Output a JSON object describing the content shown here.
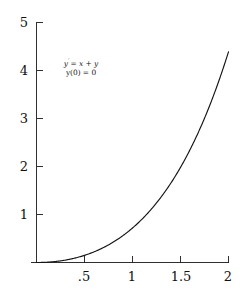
{
  "figure": {
    "background_color": "#ffffff",
    "line_color": "#141414",
    "axis_color": "#1a1a1a",
    "text_color": "#111111"
  },
  "annotation": {
    "line1_lhs": "y",
    "line1_prime": "′",
    "line1_rhs": "= x + y",
    "line2": "y(0) = 0",
    "full_text": "y' = x + y ;  y(0) = 0"
  },
  "axes": {
    "x_labels": [
      ".5",
      "1",
      "1.5",
      "2"
    ],
    "y_labels": [
      "1",
      "2",
      "3",
      "4",
      "5"
    ]
  },
  "chart_data": {
    "type": "line",
    "title": "",
    "subtitle": "",
    "xlabel": "",
    "ylabel": "",
    "xlim": [
      0,
      2
    ],
    "ylim": [
      0,
      5
    ],
    "grid": false,
    "legend": false,
    "annotations": [
      {
        "text": "y' = x + y",
        "x": 0.48,
        "y": 4.07
      },
      {
        "text": "y(0) = 0",
        "x": 0.48,
        "y": 3.87
      }
    ],
    "xticks": [
      0.5,
      1,
      1.5,
      2
    ],
    "xticklabels": [
      ".5",
      "1",
      "1.5",
      "2"
    ],
    "yticks": [
      1,
      2,
      3,
      4,
      5
    ],
    "yticklabels": [
      "1",
      "2",
      "3",
      "4",
      "5"
    ],
    "series": [
      {
        "name": "y = e^x - x - 1",
        "equation": "y = e^x - x - 1",
        "description": "Solution of the initial value problem y' = x + y, y(0) = 0",
        "x": [
          0,
          0.1,
          0.2,
          0.3,
          0.4,
          0.5,
          0.6,
          0.7,
          0.8,
          0.9,
          1.0,
          1.1,
          1.2,
          1.3,
          1.4,
          1.5,
          1.6,
          1.7,
          1.8,
          1.9,
          2.0
        ],
        "values": [
          0,
          0.0052,
          0.0214,
          0.0499,
          0.0918,
          0.1487,
          0.2221,
          0.3138,
          0.4255,
          0.5596,
          0.7183,
          0.9042,
          1.1201,
          1.3693,
          1.6552,
          1.9817,
          2.353,
          2.7737,
          3.2496,
          3.7866,
          4.3891
        ]
      }
    ]
  }
}
